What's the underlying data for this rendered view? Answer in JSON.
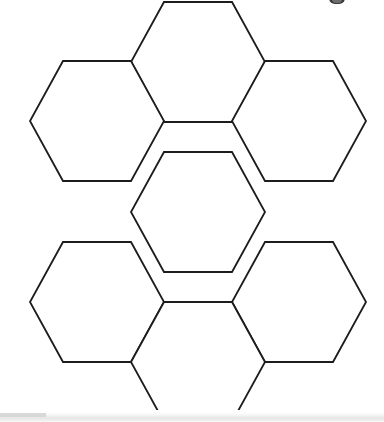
{
  "page": {
    "background_color": "#ffffff",
    "width": 384,
    "height": 422
  },
  "figure": {
    "name": "honeycomb-flower",
    "stroke_color": "#1c1c1c",
    "fill_color": "#ffffff",
    "stroke_width": 1.8,
    "cell_count": 7,
    "orientation": "flat-top",
    "geometry": {
      "center_x": 198,
      "center_y": 212,
      "half_width": 67,
      "half_height": 60,
      "top_edge_half_length": 34,
      "row_offset_y": 90,
      "column_offset_x": 67
    },
    "cells": [
      {
        "id": "hex-top",
        "label": "Top",
        "cx": 198,
        "cy": 62
      },
      {
        "id": "hex-upper-left",
        "label": "Upper Left",
        "cx": 97,
        "cy": 121
      },
      {
        "id": "hex-upper-right",
        "label": "Upper Right",
        "cx": 299,
        "cy": 121
      },
      {
        "id": "hex-center",
        "label": "Center",
        "cx": 198,
        "cy": 212
      },
      {
        "id": "hex-lower-left",
        "label": "Lower Left",
        "cx": 97,
        "cy": 302
      },
      {
        "id": "hex-lower-right",
        "label": "Lower Right",
        "cx": 299,
        "cy": 302
      },
      {
        "id": "hex-bottom",
        "label": "Bottom",
        "cx": 198,
        "cy": 362
      }
    ]
  },
  "bottom_band": {
    "name": "bottom-edge-band",
    "color": "#e6e6e6"
  },
  "top_right_mark": {
    "name": "clipped-mark",
    "color": "#3a3a3a"
  }
}
